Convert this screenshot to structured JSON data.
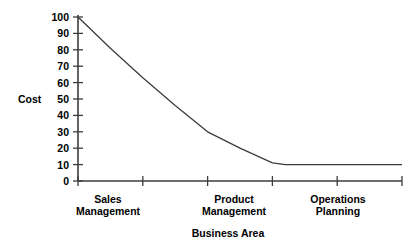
{
  "chart_data": {
    "type": "line",
    "title": "",
    "xlabel": "Business Area",
    "ylabel": "Cost",
    "ylim": [
      0,
      100
    ],
    "yticks": [
      0,
      10,
      20,
      30,
      40,
      50,
      60,
      70,
      80,
      90,
      100
    ],
    "ytick_labels": [
      "0",
      "10",
      "20",
      "30",
      "40",
      "50",
      "60",
      "70",
      "80",
      "90",
      "100"
    ],
    "xlim": [
      0,
      5
    ],
    "xticks": [
      0,
      1,
      2,
      3,
      4,
      5
    ],
    "grid": false,
    "legend": null,
    "categories": [
      "Sales Management",
      "Product Management",
      "Operations Planning"
    ],
    "category_positions": [
      0.5,
      2.0,
      3.5
    ],
    "series": [
      {
        "name": "Cost",
        "color": "#3c3c3c",
        "x": [
          0.0,
          0.5,
          1.0,
          1.5,
          2.0,
          2.5,
          3.0,
          3.2,
          4.0,
          5.0
        ],
        "values": [
          100,
          81,
          63,
          46,
          30,
          20,
          11,
          10,
          10,
          10
        ]
      }
    ],
    "annotations": []
  },
  "axis": {
    "ylabel_text": "Cost",
    "xlabel_text": "Business Area"
  },
  "ticks": {
    "y": [
      "100",
      "90",
      "80",
      "70",
      "60",
      "50",
      "40",
      "30",
      "20",
      "10",
      "0"
    ]
  },
  "categories": {
    "c0_line1": "Sales",
    "c0_line2": "Management",
    "c1_line1": "Product",
    "c1_line2": "Management",
    "c2_line1": "Operations",
    "c2_line2": "Planning"
  },
  "colors": {
    "line": "#3c3c3c",
    "axis": "#3c3c3c",
    "text": "#000000",
    "background": "#ffffff"
  }
}
